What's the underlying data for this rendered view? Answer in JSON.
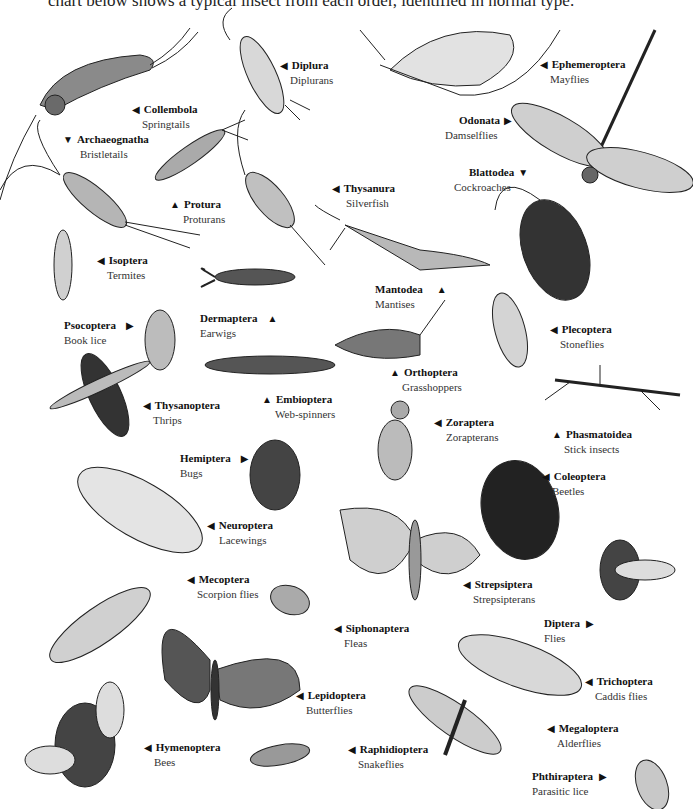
{
  "intro_text": "chart below shows a typical insect from each order, identified in normal type.",
  "labels": [
    {
      "order": "Collembola",
      "common": "Springtails",
      "arrow": "◀"
    },
    {
      "order": "Diplura",
      "common": "Diplurans",
      "arrow": "◀"
    },
    {
      "order": "Ephemeroptera",
      "common": "Mayflies",
      "arrow": "◀"
    },
    {
      "order": "Archaeognatha",
      "common": "Bristletails",
      "arrow": "▼"
    },
    {
      "order": "Odonata",
      "common": "Damselflies",
      "arrow": "▶"
    },
    {
      "order": "Blattodea",
      "common": "Cockroaches",
      "arrow": "▼"
    },
    {
      "order": "Protura",
      "common": "Proturans",
      "arrow": "▲"
    },
    {
      "order": "Thysanura",
      "common": "Silverfish",
      "arrow": "◀"
    },
    {
      "order": "Isoptera",
      "common": "Termites",
      "arrow": "◀"
    },
    {
      "order": "Mantodea",
      "common": "Mantises",
      "arrow": "▲"
    },
    {
      "order": "Dermaptera",
      "common": "Earwigs",
      "arrow": "▲"
    },
    {
      "order": "Psocoptera",
      "common": "Book lice",
      "arrow": "▶"
    },
    {
      "order": "Plecoptera",
      "common": "Stoneflies",
      "arrow": "◀"
    },
    {
      "order": "Orthoptera",
      "common": "Grasshoppers",
      "arrow": "▲"
    },
    {
      "order": "Thysanoptera",
      "common": "Thrips",
      "arrow": "◀"
    },
    {
      "order": "Embioptera",
      "common": "Web-spinners",
      "arrow": "▲"
    },
    {
      "order": "Zoraptera",
      "common": "Zorapterans",
      "arrow": "◀"
    },
    {
      "order": "Phasmatoidea",
      "common": "Stick insects",
      "arrow": "▲"
    },
    {
      "order": "Hemiptera",
      "common": "Bugs",
      "arrow": "▶"
    },
    {
      "order": "Coleoptera",
      "common": "Beetles",
      "arrow": "◀"
    },
    {
      "order": "Neuroptera",
      "common": "Lacewings",
      "arrow": "◀"
    },
    {
      "order": "Strepsiptera",
      "common": "Strepsipterans",
      "arrow": "◀"
    },
    {
      "order": "Mecoptera",
      "common": "Scorpion flies",
      "arrow": "◀"
    },
    {
      "order": "Siphonaptera",
      "common": "Fleas",
      "arrow": "◀"
    },
    {
      "order": "Diptera",
      "common": "Flies",
      "arrow": "▶"
    },
    {
      "order": "Trichoptera",
      "common": "Caddis flies",
      "arrow": "◀"
    },
    {
      "order": "Lepidoptera",
      "common": "Butterflies",
      "arrow": "◀"
    },
    {
      "order": "Megaloptera",
      "common": "Alderflies",
      "arrow": "◀"
    },
    {
      "order": "Hymenoptera",
      "common": "Bees",
      "arrow": "◀"
    },
    {
      "order": "Raphidioptera",
      "common": "Snakeflies",
      "arrow": "◀"
    },
    {
      "order": "Phthiraptera",
      "common": "Parasitic lice",
      "arrow": "▶"
    }
  ]
}
